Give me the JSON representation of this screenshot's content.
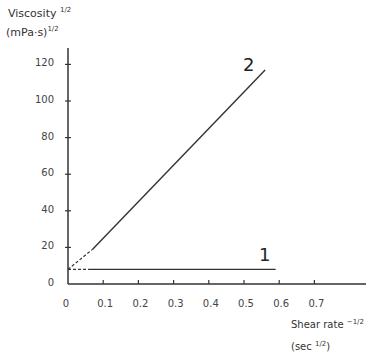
{
  "chart_data": {
    "type": "line",
    "title": "",
    "ylabel": "Viscosity",
    "ylabel_exp": "1/2",
    "ylabel_unit": "(mPa·s)",
    "ylabel_unit_exp": "1/2",
    "xlabel": "Shear rate",
    "xlabel_exp": "−1/2",
    "xlabel_unit": "(sec",
    "xlabel_unit_exp": "1/2",
    "xlabel_unit_close": ")",
    "xlim": [
      0,
      0.8
    ],
    "ylim": [
      0,
      130
    ],
    "grid": false,
    "legend": "none; series labeled inline with numbers",
    "x_ticks": [
      "0",
      "0.1",
      "0.2",
      "0.3",
      "0.4",
      "0.5",
      "0.6",
      "0.7"
    ],
    "y_ticks": [
      "0",
      "20",
      "40",
      "60",
      "80",
      "100",
      "120"
    ],
    "series": [
      {
        "name": "1",
        "label": "1",
        "x": [
          0.0,
          0.06,
          0.59
        ],
        "y": [
          8,
          8,
          8
        ],
        "extrapolated_dashed_segment": {
          "x": [
            0.0,
            0.06
          ],
          "y": [
            8,
            8
          ]
        }
      },
      {
        "name": "2",
        "label": "2",
        "x": [
          0.0,
          0.07,
          0.56
        ],
        "y": [
          8,
          19,
          117
        ],
        "extrapolated_dashed_segment": {
          "x": [
            0.0,
            0.07
          ],
          "y": [
            8,
            19
          ]
        }
      }
    ]
  }
}
